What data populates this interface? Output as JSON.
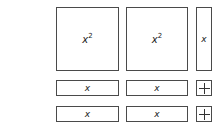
{
  "diagram": {
    "type": "algebra-tiles",
    "tiles": [
      {
        "kind": "x-squared",
        "label_base": "x",
        "label_exp": "2"
      },
      {
        "kind": "x-squared",
        "label_base": "x",
        "label_exp": "2"
      },
      {
        "kind": "x-vertical",
        "label": "x"
      },
      {
        "kind": "x-horizontal",
        "label": "x"
      },
      {
        "kind": "x-horizontal",
        "label": "x"
      },
      {
        "kind": "unit",
        "symbol": "+"
      },
      {
        "kind": "x-horizontal",
        "label": "x"
      },
      {
        "kind": "x-horizontal",
        "label": "x"
      },
      {
        "kind": "unit",
        "symbol": "+"
      }
    ],
    "colors": {
      "border": "#4a4a4a",
      "fill": "#ffffff"
    }
  }
}
